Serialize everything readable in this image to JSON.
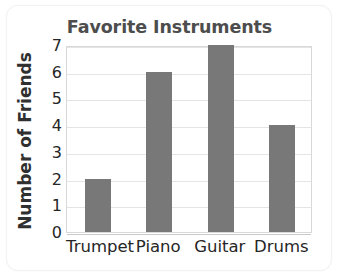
{
  "chart_data": {
    "type": "bar",
    "title": "Favorite Instruments",
    "xlabel": "",
    "ylabel": "Number of Friends",
    "categories": [
      "Trumpet",
      "Piano",
      "Guitar",
      "Drums"
    ],
    "values": [
      2,
      6,
      7,
      4
    ],
    "ylim": [
      0,
      7
    ],
    "yticks": [
      0,
      1,
      2,
      3,
      4,
      5,
      6,
      7
    ],
    "ytick_labels": [
      "0",
      "1",
      "2",
      "3",
      "4",
      "5",
      "6",
      "7"
    ],
    "grid": true,
    "legend": false,
    "bar_color": "#787878",
    "title_color": "#4d4d4d",
    "axis_text_color": "#262626",
    "gridline_color": "#e4e4e4",
    "plot_border_color": "#d8d8d8",
    "background_color": "#ffffff"
  }
}
